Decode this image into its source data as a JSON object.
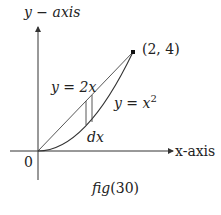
{
  "figure": {
    "caption": "fig(30)",
    "caption_parts": {
      "italic": "fig",
      "rest": "(30)"
    },
    "y_axis_label": "y − axis",
    "x_axis_label": "x-axis",
    "origin_label": "0",
    "point_label": "(2, 4)",
    "line_label": "y = 2x",
    "curve_label_base": "y = x",
    "curve_label_exp": "2",
    "strip_label": "dx"
  },
  "geometry": {
    "origin_px": [
      38,
      151
    ],
    "scale_x_px_per_unit": 47.5,
    "scale_y_px_per_unit": 24.75,
    "point": [
      2,
      4
    ],
    "strip_x_range": [
      1.01,
      1.16
    ],
    "line": "y = 2x",
    "curve": "y = x^2"
  },
  "colors": {
    "stroke": "#333333",
    "text": "#222222",
    "background": "#ffffff"
  }
}
